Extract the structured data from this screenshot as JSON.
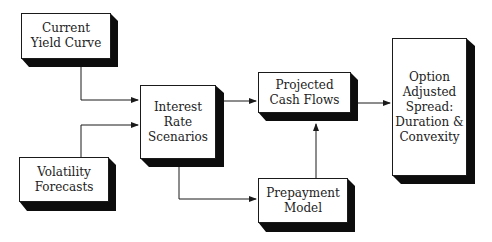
{
  "diagram": {
    "nodes": [
      {
        "id": "current-yield-curve",
        "label": "Current\nYield Curve"
      },
      {
        "id": "volatility-forecasts",
        "label": "Volatility\nForecasts"
      },
      {
        "id": "interest-rate-scenarios",
        "label": "Interest\nRate\nScenarios"
      },
      {
        "id": "projected-cash-flows",
        "label": "Projected\nCash Flows"
      },
      {
        "id": "prepayment-model",
        "label": "Prepayment\nModel"
      },
      {
        "id": "option-adjusted-spread",
        "label": "Option\nAdjusted\nSpread:\nDuration &\nConvexity"
      }
    ],
    "edges": [
      {
        "from": "current-yield-curve",
        "to": "interest-rate-scenarios"
      },
      {
        "from": "volatility-forecasts",
        "to": "interest-rate-scenarios"
      },
      {
        "from": "interest-rate-scenarios",
        "to": "projected-cash-flows"
      },
      {
        "from": "interest-rate-scenarios",
        "to": "prepayment-model"
      },
      {
        "from": "prepayment-model",
        "to": "projected-cash-flows"
      },
      {
        "from": "projected-cash-flows",
        "to": "option-adjusted-spread"
      }
    ],
    "colors": {
      "line": "#1a1a1a",
      "shadow": "#0d0d0d",
      "fill": "#ffffff"
    }
  }
}
